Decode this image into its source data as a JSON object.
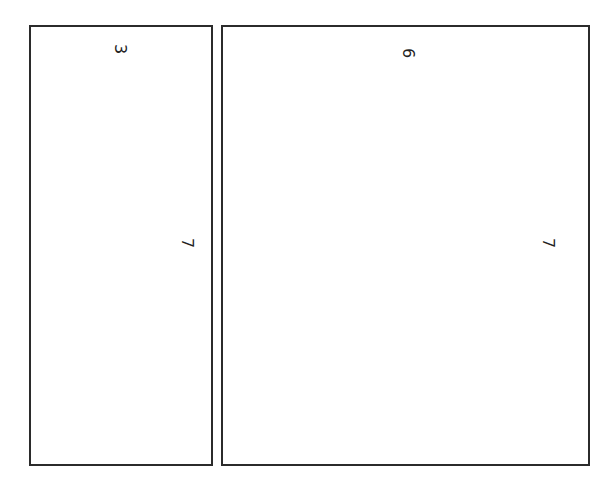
{
  "diagram": {
    "shapes": [
      {
        "id": "left-rectangle",
        "width_label": "3",
        "height_label": "7",
        "box": {
          "left": 29,
          "top": 25,
          "width": 184,
          "height": 441
        },
        "width_label_pos": {
          "x": 120,
          "y": 49
        },
        "height_label_pos": {
          "x": 187,
          "y": 243
        }
      },
      {
        "id": "right-rectangle",
        "width_label": "6",
        "height_label": "7",
        "box": {
          "left": 221,
          "top": 25,
          "width": 369,
          "height": 441
        },
        "width_label_pos": {
          "x": 408,
          "y": 53
        },
        "height_label_pos": {
          "x": 548,
          "y": 243
        }
      }
    ],
    "colors": {
      "stroke": "#2b2b2b",
      "fill": "#ffffff",
      "text": "#222222"
    }
  }
}
